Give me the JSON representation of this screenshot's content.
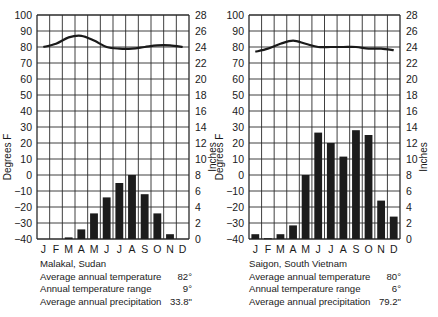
{
  "chart_data": [
    {
      "type": "bar+line",
      "title": "Malakal, Sudan",
      "categories": [
        "J",
        "F",
        "M",
        "A",
        "M",
        "J",
        "J",
        "A",
        "S",
        "O",
        "N",
        "D"
      ],
      "series": [
        {
          "name": "Temperature (°F)",
          "type": "line",
          "axis": "left",
          "values": [
            80,
            82,
            86,
            87,
            84,
            80,
            79,
            79,
            80,
            81,
            81,
            80
          ]
        },
        {
          "name": "Precipitation (inches)",
          "type": "bar",
          "axis": "right",
          "values": [
            0,
            0,
            0.2,
            1.2,
            3.2,
            5.2,
            7.0,
            8.0,
            5.6,
            3.2,
            0.6,
            0
          ]
        }
      ],
      "ylabel": "Degrees F",
      "ylabel_right": "Inches",
      "ylim": [
        -40,
        100
      ],
      "ylim_right": [
        0,
        28
      ],
      "yticks": [
        100,
        90,
        80,
        70,
        60,
        50,
        40,
        30,
        20,
        10,
        0,
        -10,
        -20,
        -30,
        -40
      ],
      "yticks_right": [
        28,
        26,
        24,
        22,
        20,
        18,
        16,
        14,
        12,
        10,
        8,
        6,
        4,
        2,
        0
      ],
      "grid": true,
      "stats": {
        "avg_temp_label": "Average annual temperature",
        "avg_temp": "82°",
        "range_label": "Annual temperature range",
        "range": "9°",
        "precip_label": "Average annual precipitation",
        "precip": "33.8\""
      }
    },
    {
      "type": "bar+line",
      "title": "Saigon, South Vietnam",
      "categories": [
        "J",
        "F",
        "M",
        "A",
        "M",
        "J",
        "J",
        "A",
        "S",
        "O",
        "N",
        "D"
      ],
      "series": [
        {
          "name": "Temperature (°F)",
          "type": "line",
          "axis": "left",
          "values": [
            77,
            79,
            82,
            84,
            82,
            80,
            80,
            80,
            80,
            79,
            79,
            78
          ]
        },
        {
          "name": "Precipitation (inches)",
          "type": "bar",
          "axis": "right",
          "values": [
            0.6,
            0.1,
            0.6,
            1.7,
            8.0,
            13.3,
            12.0,
            10.3,
            13.6,
            13.0,
            4.8,
            2.8
          ]
        }
      ],
      "ylabel": "Degrees F",
      "ylabel_right": "Inches",
      "ylim": [
        -40,
        100
      ],
      "ylim_right": [
        0,
        28
      ],
      "yticks": [
        100,
        90,
        80,
        70,
        60,
        50,
        40,
        30,
        20,
        10,
        0,
        -10,
        -20,
        -30,
        -40
      ],
      "yticks_right": [
        28,
        26,
        24,
        22,
        20,
        18,
        16,
        14,
        12,
        10,
        8,
        6,
        4,
        2,
        0
      ],
      "grid": true,
      "stats": {
        "avg_temp_label": "Average annual temperature",
        "avg_temp": "80°",
        "range_label": "Annual temperature range",
        "range": "6°",
        "precip_label": "Average annual precipitation",
        "precip": "79.2\""
      }
    }
  ],
  "panels": [
    {
      "city": "Malakal, Sudan",
      "avg_temp_label": "Average annual temperature",
      "avg_temp": "82°",
      "range_label": "Annual temperature range",
      "range": "9°",
      "precip_label": "Average annual precipitation",
      "precip": "33.8\""
    },
    {
      "city": "Saigon, South Vietnam",
      "avg_temp_label": "Average annual temperature",
      "avg_temp": "80°",
      "range_label": "Annual temperature range",
      "range": "6°",
      "precip_label": "Average annual precipitation",
      "precip": "79.2\""
    }
  ],
  "colors": {
    "ink": "#1a1a1a",
    "bar": "#1c1c1c",
    "grid": "#2a2a2a",
    "background": "#ffffff"
  }
}
